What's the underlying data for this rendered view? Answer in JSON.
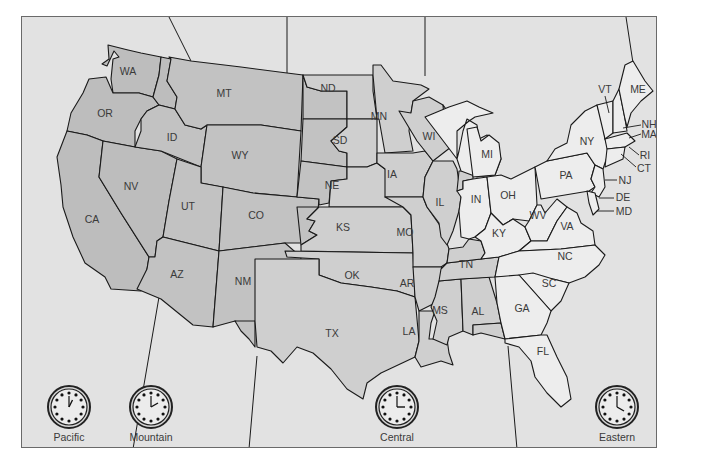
{
  "colors": {
    "background": "#e2e2e2",
    "pacific_fill": "#bdbdbd",
    "mountain_fill": "#c2c2c2",
    "central_fill": "#cfcfcf",
    "eastern_fill": "#ededed",
    "border": "#1a1a1a"
  },
  "time_zones": [
    {
      "name": "Pacific",
      "clock_time": "1:00"
    },
    {
      "name": "Mountain",
      "clock_time": "2:00"
    },
    {
      "name": "Central",
      "clock_time": "3:00"
    },
    {
      "name": "Eastern",
      "clock_time": "4:00"
    }
  ],
  "states": {
    "WA": "WA",
    "OR": "OR",
    "CA": "CA",
    "NV": "NV",
    "ID": "ID",
    "MT": "MT",
    "WY": "WY",
    "UT": "UT",
    "CO": "CO",
    "AZ": "AZ",
    "NM": "NM",
    "ND": "ND",
    "SD": "SD",
    "NE": "NE",
    "KS": "KS",
    "OK": "OK",
    "TX": "TX",
    "MN": "MN",
    "IA": "IA",
    "MO": "MO",
    "AR": "AR",
    "LA": "LA",
    "WI": "WI",
    "IL": "IL",
    "MS": "MS",
    "AL": "AL",
    "TN": "TN",
    "MI": "MI",
    "IN": "IN",
    "OH": "OH",
    "KY": "KY",
    "WV": "WV",
    "VA": "VA",
    "NC": "NC",
    "SC": "SC",
    "GA": "GA",
    "FL": "FL",
    "PA": "PA",
    "NY": "NY",
    "VT": "VT",
    "ME": "ME",
    "NH": "NH",
    "MA": "MA",
    "RI": "RI",
    "CT": "CT",
    "NJ": "NJ",
    "DE": "DE",
    "MD": "MD"
  }
}
